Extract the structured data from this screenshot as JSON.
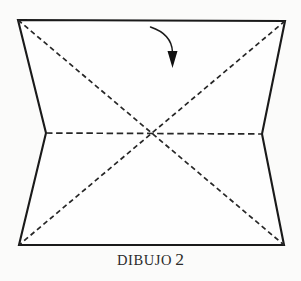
{
  "figure": {
    "caption_word": "DIBUJO",
    "caption_number": "2",
    "background_color": "#fbfbfa",
    "paper_fill_color": "#fefefe",
    "ink_color": "#1a1a1a",
    "crease_color": "#262626",
    "paper_outline_points": "18,20 285,21 262,134 284,245 19,245 46,133",
    "creases": [
      {
        "name": "horizontal-valley-crease",
        "style": "dashed",
        "points": "46,133 262,134"
      },
      {
        "name": "diagonal-crease-tl-br",
        "style": "dashed",
        "points": "18,20 284,245"
      },
      {
        "name": "diagonal-crease-tr-bl",
        "style": "dashed",
        "points": "285,21 19,245"
      }
    ],
    "center_point": "151,134",
    "arrow": {
      "name": "fold-direction-arrow",
      "curve_path": "M 150.5,27 C 164,31.5 172,40 172.5,52",
      "head_points": "167.5,51 177.5,51 172.5,68"
    }
  }
}
